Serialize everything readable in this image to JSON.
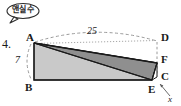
{
  "annotation": {
    "bubble_text": "앤실수",
    "bubble_shape": "speech-bubble-ellipse"
  },
  "problem": {
    "number": "4."
  },
  "figure": {
    "type": "geometry-diagram",
    "vertices": [
      {
        "id": "A",
        "label": "A",
        "x": 33,
        "y": 42
      },
      {
        "id": "B",
        "label": "B",
        "x": 33,
        "y": 80
      },
      {
        "id": "C",
        "label": "C",
        "x": 157,
        "y": 77
      },
      {
        "id": "D",
        "label": "D",
        "x": 157,
        "y": 40
      },
      {
        "id": "E",
        "label": "E",
        "x": 152,
        "y": 80
      },
      {
        "id": "F",
        "label": "F",
        "x": 157,
        "y": 63
      }
    ],
    "measures": [
      {
        "id": "ad",
        "label": "25",
        "along": "A-D",
        "style": "dashed-arc"
      },
      {
        "id": "ab",
        "label": "7",
        "along": "A-B",
        "style": "dashed-arc"
      },
      {
        "id": "ec",
        "label": "x",
        "along": "E-C",
        "style": "arrow-callout"
      }
    ],
    "colors": {
      "fill_light": "#c9c9c9",
      "fill_dark": "#8f8f8f",
      "stroke": "#1a1a1a",
      "dashed": "#8a8a8a",
      "background": "#ffffff"
    }
  }
}
